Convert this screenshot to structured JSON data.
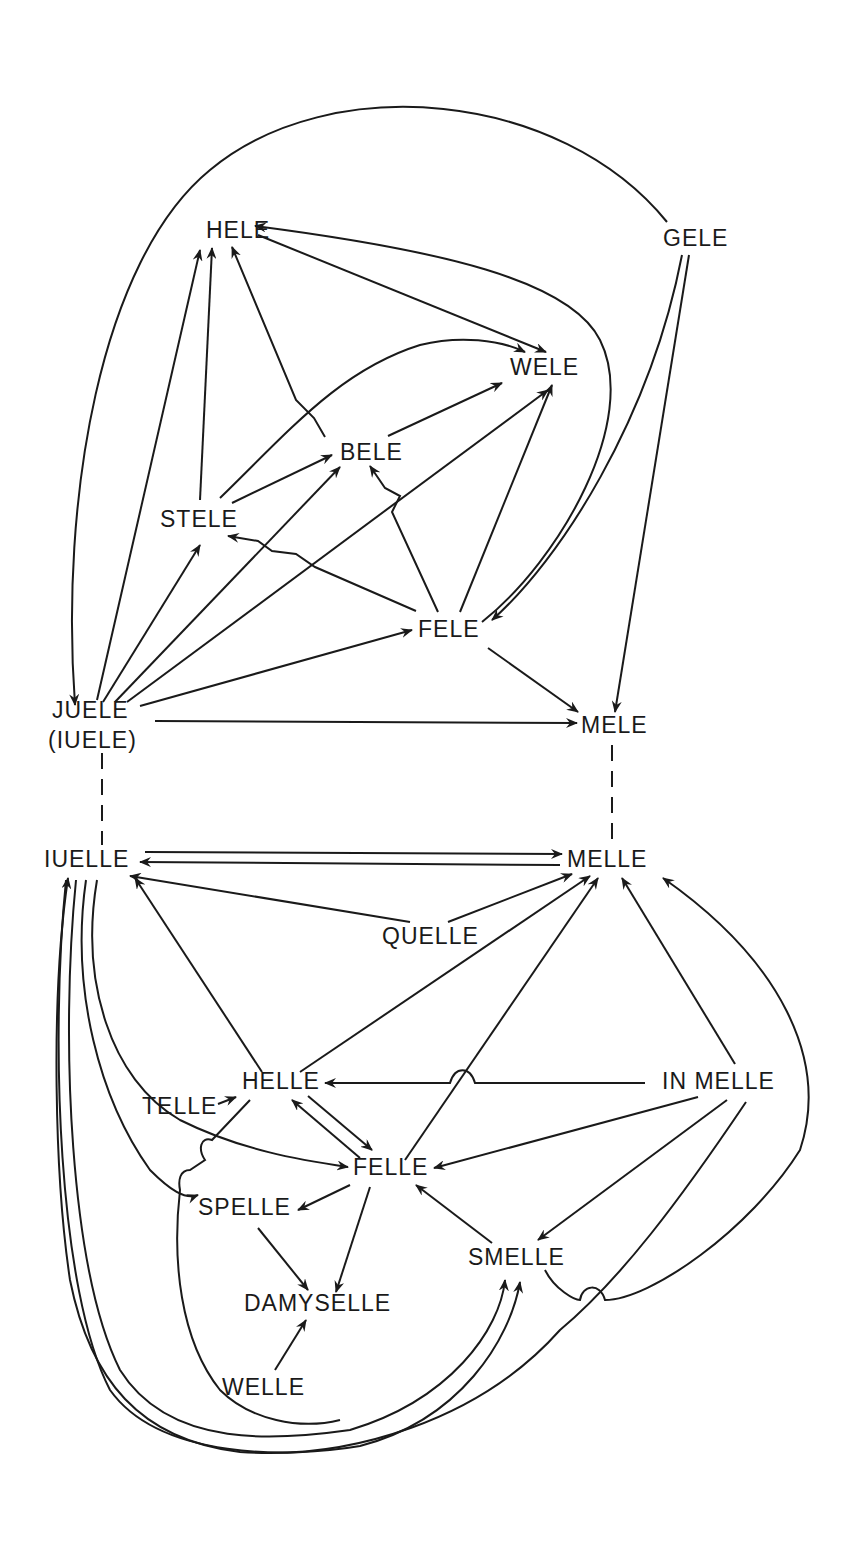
{
  "diagram": {
    "type": "directed-graph",
    "nodes": [
      {
        "id": "hele",
        "label": "HELE",
        "x": 206,
        "y": 238
      },
      {
        "id": "gele",
        "label": "GELE",
        "x": 663,
        "y": 246
      },
      {
        "id": "wele",
        "label": "WELE",
        "x": 510,
        "y": 375
      },
      {
        "id": "bele",
        "label": "BELE",
        "x": 340,
        "y": 460
      },
      {
        "id": "stele",
        "label": "STELE",
        "x": 160,
        "y": 527
      },
      {
        "id": "fele",
        "label": "FELE",
        "x": 418,
        "y": 637
      },
      {
        "id": "juele",
        "label": "JUELE",
        "x": 52,
        "y": 718
      },
      {
        "id": "juele_alt",
        "label": "(IUELE)",
        "x": 48,
        "y": 748
      },
      {
        "id": "mele",
        "label": "MELE",
        "x": 581,
        "y": 733
      },
      {
        "id": "iuelle",
        "label": "IUELLE",
        "x": 44,
        "y": 867
      },
      {
        "id": "melle",
        "label": "MELLE",
        "x": 567,
        "y": 867
      },
      {
        "id": "quelle",
        "label": "QUELLE",
        "x": 382,
        "y": 944
      },
      {
        "id": "helle",
        "label": "HELLE",
        "x": 242,
        "y": 1089
      },
      {
        "id": "in_melle",
        "label": "IN MELLE",
        "x": 662,
        "y": 1089
      },
      {
        "id": "telle",
        "label": "TELLE",
        "x": 142,
        "y": 1114
      },
      {
        "id": "felle",
        "label": "FELLE",
        "x": 353,
        "y": 1175
      },
      {
        "id": "spelle",
        "label": "SPELLE",
        "x": 198,
        "y": 1215
      },
      {
        "id": "smelle",
        "label": "SMELLE",
        "x": 468,
        "y": 1265
      },
      {
        "id": "damyselle",
        "label": "DAMYSELLE",
        "x": 244,
        "y": 1311
      },
      {
        "id": "welle",
        "label": "WELLE",
        "x": 222,
        "y": 1395
      }
    ],
    "edges": [
      {
        "from": "gele",
        "to": "juele",
        "style": "solid",
        "arrow": "end"
      },
      {
        "from": "gele",
        "to": "fele",
        "style": "solid",
        "arrow": "end"
      },
      {
        "from": "gele",
        "to": "mele",
        "style": "solid",
        "arrow": "end"
      },
      {
        "from": "wele",
        "to": "hele",
        "style": "solid",
        "arrow": "end"
      },
      {
        "from": "hele",
        "to": "wele",
        "style": "solid",
        "arrow": "end"
      },
      {
        "from": "bele",
        "to": "hele",
        "style": "solid",
        "arrow": "end"
      },
      {
        "from": "stele",
        "to": "hele",
        "style": "solid",
        "arrow": "end"
      },
      {
        "from": "stele",
        "to": "wele",
        "style": "solid",
        "arrow": "end"
      },
      {
        "from": "stele",
        "to": "bele",
        "style": "solid",
        "arrow": "end"
      },
      {
        "from": "bele",
        "to": "wele",
        "style": "solid",
        "arrow": "end"
      },
      {
        "from": "fele",
        "to": "bele",
        "style": "solid",
        "arrow": "end"
      },
      {
        "from": "fele",
        "to": "stele",
        "style": "solid",
        "arrow": "end"
      },
      {
        "from": "fele",
        "to": "wele",
        "style": "solid",
        "arrow": "end"
      },
      {
        "from": "fele",
        "to": "mele",
        "style": "solid",
        "arrow": "end"
      },
      {
        "from": "juele",
        "to": "hele",
        "style": "solid",
        "arrow": "end"
      },
      {
        "from": "juele",
        "to": "stele",
        "style": "solid",
        "arrow": "end"
      },
      {
        "from": "juele",
        "to": "bele",
        "style": "solid",
        "arrow": "end"
      },
      {
        "from": "juele",
        "to": "wele",
        "style": "solid",
        "arrow": "end"
      },
      {
        "from": "juele",
        "to": "fele",
        "style": "solid",
        "arrow": "end"
      },
      {
        "from": "juele",
        "to": "mele",
        "style": "solid",
        "arrow": "end"
      },
      {
        "from": "juele",
        "to": "iuelle",
        "style": "dashed",
        "arrow": "none"
      },
      {
        "from": "mele",
        "to": "melle",
        "style": "dashed",
        "arrow": "none"
      },
      {
        "from": "iuelle",
        "to": "melle",
        "style": "solid",
        "arrow": "end"
      },
      {
        "from": "melle",
        "to": "iuelle",
        "style": "solid",
        "arrow": "end"
      },
      {
        "from": "quelle",
        "to": "iuelle",
        "style": "solid",
        "arrow": "end"
      },
      {
        "from": "quelle",
        "to": "melle",
        "style": "solid",
        "arrow": "end"
      },
      {
        "from": "helle",
        "to": "iuelle",
        "style": "solid",
        "arrow": "end"
      },
      {
        "from": "helle",
        "to": "melle",
        "style": "solid",
        "arrow": "end"
      },
      {
        "from": "felle",
        "to": "melle",
        "style": "solid",
        "arrow": "end"
      },
      {
        "from": "in_melle",
        "to": "melle",
        "style": "solid",
        "arrow": "end"
      },
      {
        "from": "smelle",
        "to": "melle",
        "style": "solid",
        "arrow": "end"
      },
      {
        "from": "in_melle",
        "to": "helle",
        "style": "solid",
        "arrow": "end"
      },
      {
        "from": "in_melle",
        "to": "felle",
        "style": "solid",
        "arrow": "end"
      },
      {
        "from": "in_melle",
        "to": "smelle",
        "style": "solid",
        "arrow": "end"
      },
      {
        "from": "in_melle",
        "to": "iuelle",
        "style": "solid",
        "arrow": "end"
      },
      {
        "from": "telle",
        "to": "helle",
        "style": "solid",
        "arrow": "end"
      },
      {
        "from": "helle",
        "to": "felle",
        "style": "solid",
        "arrow": "end"
      },
      {
        "from": "felle",
        "to": "helle",
        "style": "solid",
        "arrow": "end"
      },
      {
        "from": "iuelle",
        "to": "felle",
        "style": "solid",
        "arrow": "end"
      },
      {
        "from": "iuelle",
        "to": "spelle",
        "style": "solid",
        "arrow": "end"
      },
      {
        "from": "iuelle",
        "to": "smelle",
        "style": "solid",
        "arrow": "end"
      },
      {
        "from": "helle",
        "to": "smelle",
        "style": "solid",
        "arrow": "end"
      },
      {
        "from": "felle",
        "to": "spelle",
        "style": "solid",
        "arrow": "end"
      },
      {
        "from": "felle",
        "to": "damyselle",
        "style": "solid",
        "arrow": "end"
      },
      {
        "from": "smelle",
        "to": "felle",
        "style": "solid",
        "arrow": "end"
      },
      {
        "from": "spelle",
        "to": "damyselle",
        "style": "solid",
        "arrow": "end"
      },
      {
        "from": "welle",
        "to": "damyselle",
        "style": "solid",
        "arrow": "end"
      }
    ]
  }
}
